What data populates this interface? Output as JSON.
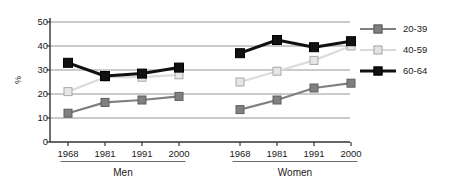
{
  "chart_data": {
    "type": "line",
    "title": "",
    "xlabel": "",
    "ylabel": "%",
    "ylim": [
      0,
      50
    ],
    "yticks": [
      0,
      10,
      20,
      30,
      40,
      50
    ],
    "grid": "horizontal",
    "legend_position": "right",
    "groups": [
      {
        "name": "Men",
        "x": [
          "1968",
          "1981",
          "1991",
          "2000"
        ],
        "series": [
          {
            "name": "20-39",
            "values": [
              12,
              16.5,
              17.5,
              19
            ]
          },
          {
            "name": "40-59",
            "values": [
              21,
              27,
              27,
              28
            ]
          },
          {
            "name": "60-64",
            "values": [
              33,
              27.5,
              28.5,
              31
            ]
          }
        ]
      },
      {
        "name": "Women",
        "x": [
          "1968",
          "1981",
          "1991",
          "2000"
        ],
        "series": [
          {
            "name": "20-39",
            "values": [
              13.5,
              17.5,
              22.5,
              24.5
            ]
          },
          {
            "name": "40-59",
            "values": [
              25,
              29.5,
              34,
              40
            ]
          },
          {
            "name": "60-64",
            "values": [
              37,
              42.5,
              39.5,
              42
            ]
          }
        ]
      }
    ],
    "legend": [
      {
        "label": "20-39",
        "color": "#808080"
      },
      {
        "label": "40-59",
        "color": "#d9d9d9"
      },
      {
        "label": "60-64",
        "color": "#111111"
      }
    ],
    "colors": {
      "series_20_39": "#808080",
      "series_40_59": "#d9d9d9",
      "series_60_64": "#111111",
      "axis": "#333333",
      "grid": "#8a8a8a",
      "background": "#ffffff"
    }
  }
}
